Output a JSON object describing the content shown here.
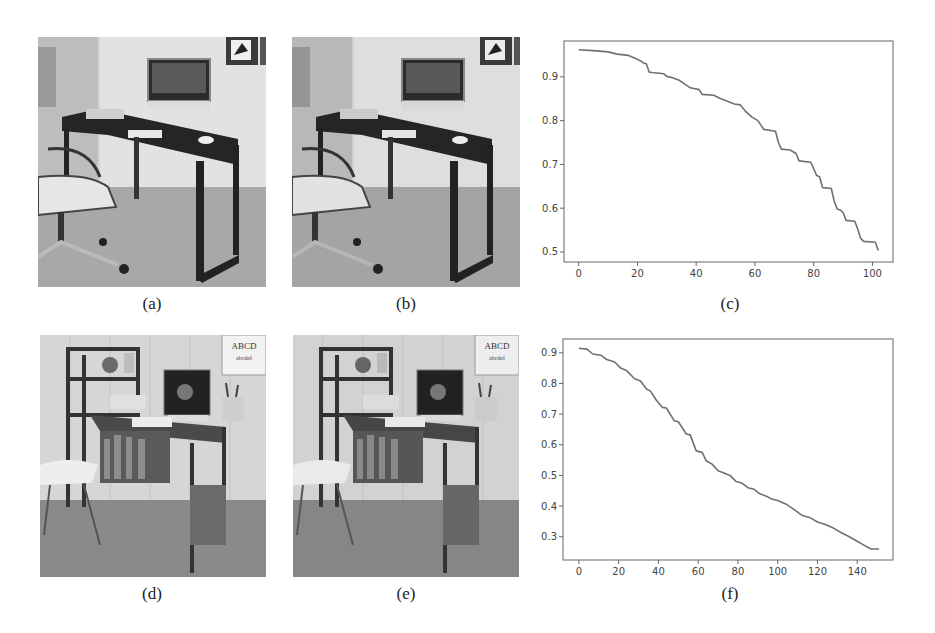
{
  "figure": {
    "panels": [
      {
        "id": "a",
        "caption": "(a)",
        "kind": "photo",
        "description": "Home office: dark rectangular desk with all-in-one computer, keyboard, books, swivel chair"
      },
      {
        "id": "b",
        "caption": "(b)",
        "kind": "photo",
        "description": "Same desk scene as (a), processed variant"
      },
      {
        "id": "c",
        "caption": "(c)",
        "kind": "chart"
      },
      {
        "id": "d",
        "caption": "(d)",
        "kind": "photo",
        "description": "Desk with attached bookshelf, monitor, pen holder, white chair, wall poster"
      },
      {
        "id": "e",
        "caption": "(e)",
        "kind": "photo",
        "description": "Same bookshelf desk scene as (d), processed variant"
      },
      {
        "id": "f",
        "caption": "(f)",
        "kind": "chart"
      }
    ]
  },
  "chart_data": [
    {
      "panel": "c",
      "type": "line",
      "title": "",
      "xlabel": "",
      "ylabel": "",
      "xlim": [
        -5,
        107
      ],
      "ylim": [
        0.477,
        0.982
      ],
      "xticks": [
        0,
        20,
        40,
        60,
        80,
        100
      ],
      "yticks": [
        0.5,
        0.6,
        0.7,
        0.8,
        0.9
      ],
      "grid": false,
      "legend": null,
      "color": "#707070",
      "x": [
        0,
        5,
        10,
        13,
        17,
        19,
        21,
        22,
        23,
        24,
        25,
        29,
        30,
        32,
        34,
        36,
        38,
        41,
        42,
        46,
        48,
        50,
        53,
        55,
        57,
        59,
        61,
        63,
        67,
        68,
        69,
        72,
        74,
        75,
        79,
        80,
        81,
        82,
        83,
        86,
        87,
        88,
        89,
        90,
        91,
        94,
        95,
        96,
        97,
        101,
        102
      ],
      "y": [
        0.962,
        0.96,
        0.957,
        0.952,
        0.949,
        0.943,
        0.937,
        0.932,
        0.93,
        0.911,
        0.91,
        0.907,
        0.901,
        0.898,
        0.893,
        0.884,
        0.875,
        0.871,
        0.86,
        0.858,
        0.851,
        0.846,
        0.838,
        0.836,
        0.82,
        0.808,
        0.8,
        0.78,
        0.776,
        0.75,
        0.735,
        0.733,
        0.725,
        0.708,
        0.705,
        0.69,
        0.675,
        0.672,
        0.647,
        0.645,
        0.615,
        0.598,
        0.596,
        0.59,
        0.572,
        0.57,
        0.552,
        0.531,
        0.524,
        0.522,
        0.503
      ]
    },
    {
      "panel": "f",
      "type": "line",
      "title": "",
      "xlabel": "",
      "ylabel": "",
      "xlim": [
        -8,
        158
      ],
      "ylim": [
        0.224,
        0.945
      ],
      "xticks": [
        0,
        20,
        40,
        60,
        80,
        100,
        120,
        140
      ],
      "yticks": [
        0.3,
        0.4,
        0.5,
        0.6,
        0.7,
        0.8,
        0.9
      ],
      "grid": false,
      "legend": null,
      "color": "#707070",
      "x": [
        0,
        4,
        7,
        11,
        14,
        18,
        21,
        24,
        28,
        31,
        34,
        36,
        39,
        42,
        44,
        48,
        50,
        54,
        56,
        59,
        62,
        64,
        67,
        70,
        73,
        76,
        79,
        82,
        85,
        88,
        91,
        94,
        97,
        100,
        104,
        108,
        112,
        116,
        120,
        124,
        128,
        132,
        136,
        140,
        144,
        147,
        151
      ],
      "y": [
        0.915,
        0.912,
        0.896,
        0.892,
        0.878,
        0.87,
        0.85,
        0.842,
        0.815,
        0.808,
        0.782,
        0.775,
        0.745,
        0.722,
        0.72,
        0.678,
        0.675,
        0.635,
        0.632,
        0.58,
        0.575,
        0.548,
        0.537,
        0.515,
        0.508,
        0.5,
        0.48,
        0.475,
        0.46,
        0.455,
        0.44,
        0.433,
        0.423,
        0.418,
        0.407,
        0.39,
        0.37,
        0.363,
        0.348,
        0.34,
        0.328,
        0.313,
        0.3,
        0.285,
        0.27,
        0.26,
        0.26
      ]
    }
  ]
}
